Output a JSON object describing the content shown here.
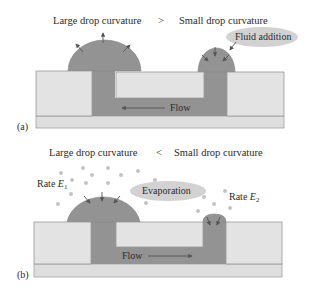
{
  "colors": {
    "background": "#ffffff",
    "substrate_fill": "#e3e3e3",
    "substrate_stroke": "#9a9a9a",
    "base_fill": "#dedede",
    "fluid_fill": "#939393",
    "fluid_stroke": "#7d7d7d",
    "arrow": "#555555",
    "bubble_fill": "#d2d2d2",
    "vapor_dot": "#c4c4c4",
    "text": "#2b2b2b"
  },
  "panel_a": {
    "tag": "(a)",
    "title_left": "Large drop curvature",
    "comparator": ">",
    "title_right": "Small drop curvature",
    "bubble_label": "Fluid addition",
    "flow_label": "Flow",
    "flow_direction": "left"
  },
  "panel_b": {
    "tag": "(b)",
    "title_left": "Large drop curvature",
    "comparator": "<",
    "title_right": "Small drop curvature",
    "bubble_label": "Evaporation",
    "rate_left": "Rate E",
    "rate_left_sub": "1",
    "rate_right": "Rate E",
    "rate_right_sub": "2",
    "flow_label": "Flow",
    "flow_direction": "right"
  }
}
